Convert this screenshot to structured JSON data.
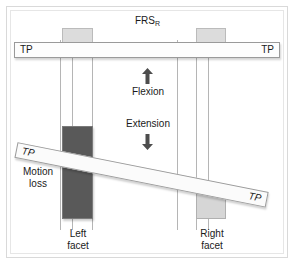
{
  "figure": {
    "title": "FRS",
    "title_subscript": "R",
    "tp_bar_horizontal": {
      "left_label": "TP",
      "right_label": "TP"
    },
    "tp_bar_diagonal": {
      "left_label": "TP",
      "right_label": "TP"
    },
    "motion": {
      "flexion_label": "Flexion",
      "flexion_arrow": "arrow-up-icon",
      "extension_label": "Extension",
      "extension_arrow": "arrow-down-icon"
    },
    "annotations": {
      "motion_loss": "Motion\nloss",
      "motion_loss_line1": "Motion",
      "motion_loss_line2": "loss",
      "left_facet_line1": "Left",
      "left_facet_line2": "facet",
      "right_facet_line1": "Right",
      "right_facet_line2": "facet"
    },
    "colors": {
      "left_facet_fill": "#595959",
      "right_facet_fill": "#d6d6d6",
      "top_facet_fill": "#dcdcdc",
      "bar_fill": "#fdfdfd",
      "outline": "#9a9a9a",
      "text": "#1a1a1a",
      "background": "#ffffff"
    }
  }
}
